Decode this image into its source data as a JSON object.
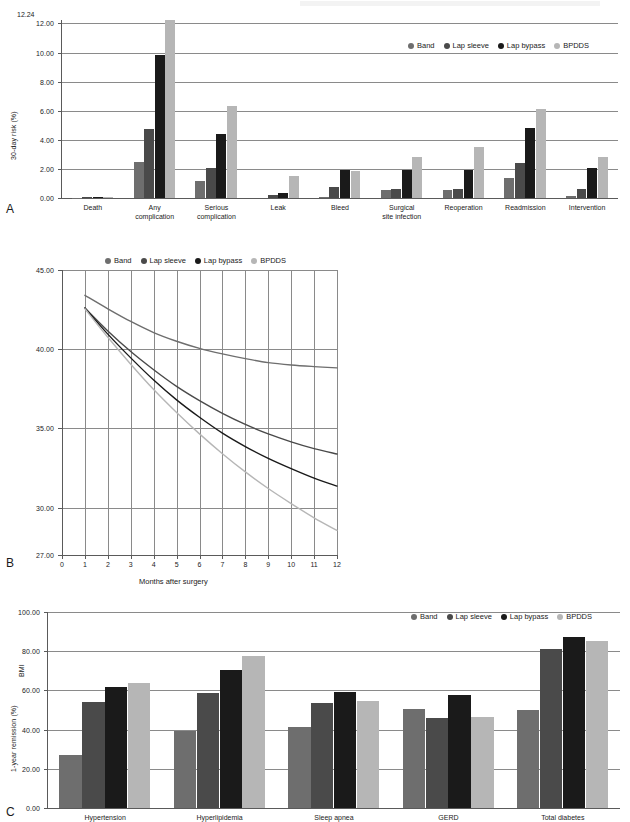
{
  "figure": {
    "series_names": [
      "Band",
      "Lap sleeve",
      "Lap bypass",
      "BPDDS"
    ],
    "series_colors": [
      "#6e6e6e",
      "#4a4a4a",
      "#1a1a1a",
      "#b6b6b6"
    ]
  },
  "panel_a": {
    "letter": "A",
    "legend": [
      {
        "label": "Band",
        "color": "#6e6e6e"
      },
      {
        "label": "Lap sleeve",
        "color": "#4a4a4a"
      },
      {
        "label": "Lap bypass",
        "color": "#1a1a1a"
      },
      {
        "label": "BPDDS",
        "color": "#b6b6b6"
      }
    ],
    "top_note": "12.24",
    "chart_data": {
      "type": "bar",
      "title": "",
      "xlabel": "",
      "ylabel": "30-day risk (%)",
      "ylim": [
        0,
        12.24
      ],
      "yticks": [
        "0.00",
        "2.00",
        "4.00",
        "6.00",
        "8.00",
        "10.00",
        "12.00"
      ],
      "ytick_values": [
        0,
        2,
        4,
        6,
        8,
        10,
        12
      ],
      "grid": true,
      "legend_position": "top-right",
      "categories": [
        "Death",
        "Any\ncomplication",
        "Serious\ncomplication",
        "Leak",
        "Bleed",
        "Surgical\nsite infection",
        "Reoperation",
        "Readmission",
        "Intervention"
      ],
      "series": [
        {
          "name": "Band",
          "values": [
            0.02,
            2.45,
            1.15,
            0.0,
            0.05,
            0.52,
            0.55,
            1.38,
            0.12
          ]
        },
        {
          "name": "Lap sleeve",
          "values": [
            0.05,
            4.75,
            2.08,
            0.24,
            0.74,
            0.62,
            0.6,
            2.4,
            0.64
          ]
        },
        {
          "name": "Lap bypass",
          "values": [
            0.08,
            9.82,
            4.42,
            0.34,
            1.9,
            1.9,
            1.9,
            4.82,
            2.08
          ]
        },
        {
          "name": "BPDDS",
          "values": [
            0.1,
            12.24,
            6.3,
            1.48,
            1.84,
            2.82,
            3.48,
            6.14,
            2.82
          ]
        }
      ]
    }
  },
  "panel_b": {
    "letter": "B",
    "legend": [
      {
        "label": "Band",
        "color": "#6e6e6e"
      },
      {
        "label": "Lap sleeve",
        "color": "#4a4a4a"
      },
      {
        "label": "Lap bypass",
        "color": "#1a1a1a"
      },
      {
        "label": "BPDDS",
        "color": "#b6b6b6"
      }
    ],
    "chart_data": {
      "type": "line",
      "title": "",
      "xlabel": "Months after surgery",
      "ylabel": "BMI",
      "xlim": [
        0,
        12
      ],
      "ylim": [
        27.0,
        45.0
      ],
      "xticks": [
        "0",
        "1",
        "2",
        "3",
        "4",
        "5",
        "6",
        "7",
        "8",
        "9",
        "10",
        "11",
        "12"
      ],
      "yticks": [
        "27.00",
        "30.00",
        "35.00",
        "40.00",
        "45.00"
      ],
      "ytick_values": [
        27,
        30,
        35,
        40,
        45
      ],
      "grid": true,
      "legend_position": "top-center",
      "x": [
        1,
        2,
        3,
        4,
        5,
        6,
        7,
        8,
        9,
        10,
        11,
        12
      ],
      "series": [
        {
          "name": "Band",
          "values": [
            43.4,
            42.55,
            41.75,
            41.05,
            40.5,
            40.05,
            39.7,
            39.4,
            39.15,
            39.0,
            38.9,
            38.82
          ]
        },
        {
          "name": "Lap sleeve",
          "values": [
            42.6,
            41.15,
            39.85,
            38.7,
            37.65,
            36.75,
            35.95,
            35.25,
            34.65,
            34.15,
            33.72,
            33.38
          ]
        },
        {
          "name": "Lap bypass",
          "values": [
            42.6,
            40.95,
            39.45,
            38.05,
            36.8,
            35.7,
            34.7,
            33.85,
            33.1,
            32.45,
            31.85,
            31.35
          ]
        },
        {
          "name": "BPDDS",
          "values": [
            42.55,
            40.75,
            39.05,
            37.45,
            36.0,
            34.65,
            33.4,
            32.25,
            31.2,
            30.25,
            29.35,
            28.55
          ]
        }
      ]
    }
  },
  "panel_c": {
    "letter": "C",
    "legend": [
      {
        "label": "Band",
        "color": "#6e6e6e"
      },
      {
        "label": "Lap sleeve",
        "color": "#4a4a4a"
      },
      {
        "label": "Lap bypass",
        "color": "#1a1a1a"
      },
      {
        "label": "BPDDS",
        "color": "#b6b6b6"
      }
    ],
    "chart_data": {
      "type": "bar",
      "title": "",
      "xlabel": "",
      "ylabel": "1-year remission (%)",
      "ylim": [
        0,
        100
      ],
      "yticks": [
        "0.00",
        "20.00",
        "40.00",
        "60.00",
        "80.00",
        "100.00"
      ],
      "ytick_values": [
        0,
        20,
        40,
        60,
        80,
        100
      ],
      "grid": true,
      "legend_position": "top-right",
      "categories": [
        "Hypertension",
        "Hyperlipidemia",
        "Sleep apnea",
        "GERD",
        "Total diabetes"
      ],
      "series": [
        {
          "name": "Band",
          "values": [
            27.0,
            39.3,
            41.2,
            50.7,
            50.2
          ]
        },
        {
          "name": "Lap sleeve",
          "values": [
            54.0,
            58.7,
            53.6,
            45.8,
            80.9
          ]
        },
        {
          "name": "Lap bypass",
          "values": [
            61.8,
            70.6,
            59.1,
            57.5,
            87.2
          ]
        },
        {
          "name": "BPDDS",
          "values": [
            64.0,
            77.6,
            54.5,
            46.2,
            85.3
          ]
        }
      ]
    }
  }
}
